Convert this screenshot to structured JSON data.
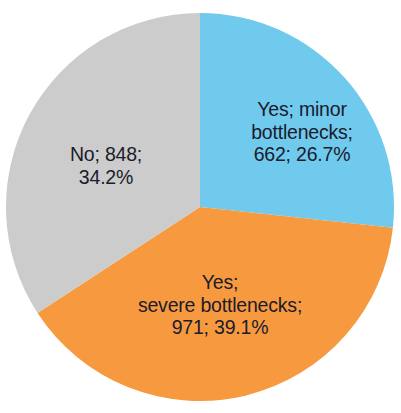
{
  "chart_data": {
    "type": "pie",
    "title": "",
    "subtitle": "",
    "xlabel": "",
    "ylabel": "",
    "legend_position": "none",
    "grid": false,
    "start_angle_deg": 0,
    "direction": "clockwise",
    "total": 2481,
    "categories": [
      "Yes; minor bottlenecks",
      "Yes; severe bottlenecks",
      "No"
    ],
    "values": [
      662,
      971,
      848
    ],
    "percentages": [
      26.7,
      39.1,
      34.2
    ],
    "colors": [
      "#6FCAEE",
      "#F79A3F",
      "#CCCCCC"
    ],
    "slices": [
      {
        "name": "Yes; minor bottlenecks",
        "value": 662,
        "percent": 26.7,
        "color": "#6FCAEE",
        "label": "Yes; minor\nbottlenecks;\n662;  26.7%",
        "label_color": "#1b1b2b"
      },
      {
        "name": "Yes; severe bottlenecks",
        "value": 971,
        "percent": 39.1,
        "color": "#F79A3F",
        "label": "Yes;\nsevere bottlenecks;\n971;  39.1%",
        "label_color": "#1b1b2b"
      },
      {
        "name": "No",
        "value": 848,
        "percent": 34.2,
        "color": "#CCCCCC",
        "label": "No; 848;\n34.2%",
        "label_color": "#1b1b2b"
      }
    ]
  },
  "figure": {
    "background": "#ffffff",
    "center_x": 200,
    "center_y": 207,
    "radius": 194
  }
}
